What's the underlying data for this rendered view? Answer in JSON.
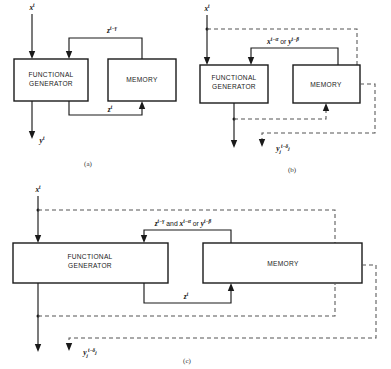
{
  "figure": {
    "caption_a": "(a)",
    "caption_b": "(b)",
    "caption_c": "(c)",
    "block_functional_generator_line1": "FUNCTIONAL",
    "block_functional_generator_line2": "GENERATOR",
    "block_memory": "MEMORY"
  },
  "signals": {
    "input_x": "x",
    "input_x_sup": "t",
    "output_y": "y",
    "output_y_sup": "t",
    "z_delayed_base": "z",
    "z_delayed_sup": "t−γ",
    "z_current_base": "z",
    "z_current_sup": "t",
    "x_delayed_base": "x",
    "x_delayed_sup": "t−α",
    "or_word": "or",
    "and_word": "and",
    "y_delayed_base": "y",
    "y_delayed_sup": "t−β",
    "y_sub_j_base": "y",
    "y_sub_j_sub": "j",
    "y_sub_j_sup": "t−δ",
    "y_sub_j_sup_sub": "j"
  },
  "colors": {
    "ink": "#1a1a1a",
    "dashed": "#555555",
    "background": "#ffffff"
  },
  "panel_a": {
    "name": "configuration-a",
    "description": "Functional generator with memory feedback loop, solid lines only"
  },
  "panel_b": {
    "name": "configuration-b",
    "description": "Functional generator with memory, dashed external delay paths"
  },
  "panel_c": {
    "name": "configuration-c",
    "description": "Combined configuration with wide blocks and both solid and dashed paths"
  }
}
